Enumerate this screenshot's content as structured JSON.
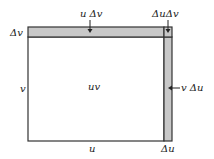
{
  "diagram": {
    "labels": {
      "top_strip": "u Δv",
      "corner": "ΔuΔv",
      "left_delta_v": "Δv",
      "left_v": "v",
      "center": "uv",
      "right_strip": "v Δu",
      "bottom_u": "u",
      "bottom_delta_u": "Δu"
    },
    "colors": {
      "strip_fill": "#c8c8c8",
      "outline": "#333333",
      "background": "#ffffff"
    }
  }
}
